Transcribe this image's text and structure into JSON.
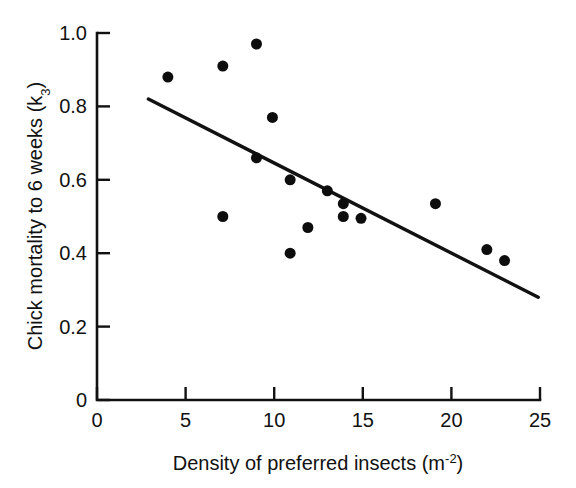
{
  "chart_data": {
    "type": "scatter",
    "title": "",
    "xlabel": "Density of preferred insects (m⁻²)",
    "xlabel_base": "Density of preferred insects (m",
    "xlabel_sup": "-2",
    "xlabel_tail": ")",
    "ylabel": "Chick mortality to 6 weeks (k₃)",
    "ylabel_base": "Chick mortality to 6 weeks (k",
    "ylabel_sub": "3",
    "ylabel_tail": ")",
    "xlim": [
      0,
      25
    ],
    "ylim": [
      0,
      1.0
    ],
    "xticks": [
      0,
      5,
      10,
      15,
      20,
      25
    ],
    "xtick_labels": [
      "0",
      "5",
      "10",
      "15",
      "20",
      "25"
    ],
    "yticks": [
      0,
      0.2,
      0.4,
      0.6,
      0.8,
      1.0
    ],
    "ytick_labels": [
      "0",
      "0.2",
      "0.4",
      "0.6",
      "0.8",
      "1.0"
    ],
    "grid": false,
    "legend": false,
    "tick_direction": "in",
    "marker": "filled-circle",
    "marker_size_px": 11,
    "point_color": "#0d0d0d",
    "line_color": "#111111",
    "x": [
      4.0,
      7.1,
      9.0,
      7.1,
      9.0,
      9.9,
      10.9,
      10.9,
      11.9,
      13.0,
      13.9,
      13.9,
      14.9,
      19.1,
      22.0,
      23.0
    ],
    "y": [
      0.88,
      0.91,
      0.97,
      0.5,
      0.66,
      0.77,
      0.6,
      0.4,
      0.47,
      0.57,
      0.535,
      0.5,
      0.495,
      0.535,
      0.41,
      0.38
    ],
    "points": [
      {
        "x": 4.0,
        "y": 0.88
      },
      {
        "x": 7.1,
        "y": 0.91
      },
      {
        "x": 9.0,
        "y": 0.97
      },
      {
        "x": 7.1,
        "y": 0.5
      },
      {
        "x": 9.0,
        "y": 0.66
      },
      {
        "x": 9.9,
        "y": 0.77
      },
      {
        "x": 10.9,
        "y": 0.6
      },
      {
        "x": 10.9,
        "y": 0.4
      },
      {
        "x": 11.9,
        "y": 0.47
      },
      {
        "x": 13.0,
        "y": 0.57
      },
      {
        "x": 13.9,
        "y": 0.535
      },
      {
        "x": 13.9,
        "y": 0.5
      },
      {
        "x": 14.9,
        "y": 0.495
      },
      {
        "x": 19.1,
        "y": 0.535
      },
      {
        "x": 22.0,
        "y": 0.41
      },
      {
        "x": 23.0,
        "y": 0.38
      }
    ],
    "trend_line": {
      "x_start": 2.9,
      "y_start": 0.82,
      "x_end": 24.9,
      "y_end": 0.28
    }
  }
}
